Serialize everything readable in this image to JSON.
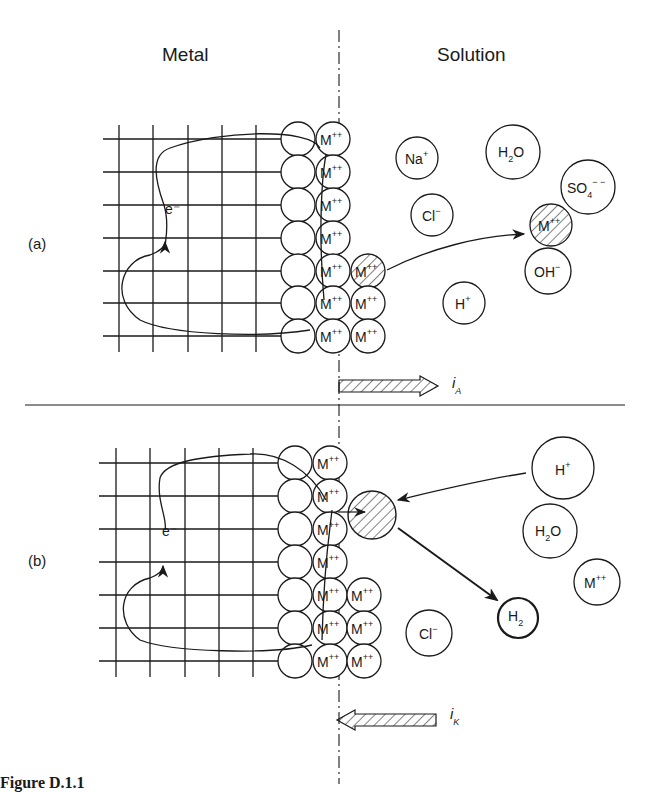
{
  "headers": {
    "metal": "Metal",
    "solution": "Solution"
  },
  "panels": [
    {
      "label": "(a)",
      "electron_label": "e⁻",
      "surface_ion": "M",
      "surface_ion_charge": "++",
      "ions": [
        {
          "base": "Na",
          "sup": "+",
          "sub": ""
        },
        {
          "base": "H",
          "sub": "2",
          "tail": "O",
          "sup": ""
        },
        {
          "base": "SO",
          "sub": "4",
          "sup": "− −"
        },
        {
          "base": "Cl",
          "sup": "−",
          "sub": ""
        },
        {
          "base": "M",
          "sup": "++",
          "sub": "",
          "hatched": true
        },
        {
          "base": "OH",
          "sup": "−",
          "sub": ""
        },
        {
          "base": "H",
          "sup": "+",
          "sub": ""
        }
      ],
      "current": {
        "symbol": "i",
        "subscript": "A",
        "direction": "right"
      }
    },
    {
      "label": "(b)",
      "electron_label": "e⁻",
      "surface_ion": "M",
      "surface_ion_charge": "++",
      "ions": [
        {
          "base": "H",
          "sup": "+",
          "sub": ""
        },
        {
          "base": "H",
          "sub": "2",
          "tail": "O",
          "sup": ""
        },
        {
          "base": "M",
          "sup": "++",
          "sub": ""
        },
        {
          "base": "H",
          "sub": "2",
          "sup": "",
          "bold_ring": true
        },
        {
          "base": "Cl",
          "sup": "−",
          "sub": ""
        }
      ],
      "current": {
        "symbol": "i",
        "subscript": "K",
        "direction": "left"
      }
    }
  ],
  "caption": "Figure D.1.1"
}
